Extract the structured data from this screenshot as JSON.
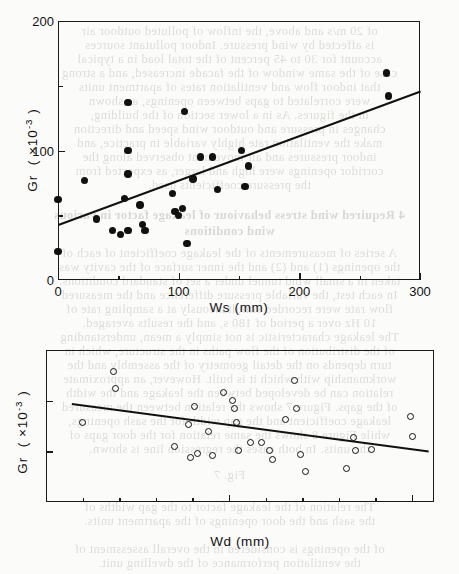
{
  "page": {
    "background_color": "#fbfbf9",
    "ink_color": "#111111"
  },
  "bleed_through_text": {
    "note": "faint mirrored show-through of text printed on the reverse side of the scanned page",
    "lines": [
      {
        "text": "of 20 m/s and above, the inflow of polluted outdoor air",
        "top": 24,
        "bold": false
      },
      {
        "text": "is affected by wind pressure.  Indoor pollutant sources",
        "top": 38,
        "bold": false
      },
      {
        "text": "account for 30 to 45 percent of the total load in a typical",
        "top": 52,
        "bold": false
      },
      {
        "text": "case of the same window of the facade increased, and a strong",
        "top": 66,
        "bold": false
      },
      {
        "text": "that indoor flow and ventilation rates of apartment units",
        "top": 80,
        "bold": false
      },
      {
        "text": "were correlated to gaps between openings, as shown",
        "top": 94,
        "bold": false
      },
      {
        "text": "in the figures.  As in a lower section of the building,",
        "top": 108,
        "bold": false
      },
      {
        "text": "changes in pressure and outdoor wind speed and direction",
        "top": 122,
        "bold": false
      },
      {
        "text": "make the ventilation rate highly variable in practice, and",
        "top": 136,
        "bold": false
      },
      {
        "text": "indoor pressures and air movement observed along the",
        "top": 150,
        "bold": false
      },
      {
        "text": "corridor openings were high and larger, as expected from",
        "top": 164,
        "bold": false
      },
      {
        "text": "the pressure coefficients used.",
        "top": 178,
        "bold": false
      },
      {
        "text": "4  Required wind stress behaviour of leakage factor in various",
        "top": 208,
        "bold": true
      },
      {
        "text": "wind conditions",
        "top": 224,
        "bold": true
      },
      {
        "text": "A series of measurements of the leakage coefficient of each of",
        "top": 246,
        "bold": false
      },
      {
        "text": "the openings (1) and (2) and the inner surface of the cavity was",
        "top": 260,
        "bold": false
      },
      {
        "text": "taken in a small wind tunnel under a set of standard conditions.",
        "top": 274,
        "bold": false
      },
      {
        "text": "In each test, the variable  pressure  difference and the measured",
        "top": 288,
        "bold": false
      },
      {
        "text": "flow rate were recorded simultaneously at a sampling rate of",
        "top": 302,
        "bold": false
      },
      {
        "text": "10 Hz over a period of 180 s, and the results averaged.",
        "top": 316,
        "bold": false
      },
      {
        "text": "The leakage characteristic is not simply a mean, understanding",
        "top": 330,
        "bold": false
      },
      {
        "text": "of the distribution of the flow paths in the structure, which in",
        "top": 344,
        "bold": false
      },
      {
        "text": "turn depends on the detail geometry of the assembly and the",
        "top": 358,
        "bold": false
      },
      {
        "text": "workmanship with which it is built.  However, an approximate",
        "top": 372,
        "bold": false
      },
      {
        "text": "relation can be developed between the leakage and the width",
        "top": 386,
        "bold": false
      },
      {
        "text": "of the gaps.  Figure 7 shows the relation between the measured",
        "top": 400,
        "bold": false
      },
      {
        "text": "leakage coefficient and the gap width for the sash openings,",
        "top": 414,
        "bold": false
      },
      {
        "text": "while Figure 8 shows the same relation for the door gaps of",
        "top": 428,
        "bold": false
      },
      {
        "text": "the units.  In both cases the regression line is shown.",
        "top": 442,
        "bold": false
      },
      {
        "text": "Fig. 7",
        "top": 468,
        "bold": false
      },
      {
        "text": "The relation of the leakage factor to the gap widths of",
        "top": 500,
        "bold": false
      },
      {
        "text": "the sash and the door openings of the apartment units.",
        "top": 514,
        "bold": false
      },
      {
        "text": "of the openings is considered in the overall assessment of",
        "top": 542,
        "bold": false
      },
      {
        "text": "the ventilation performance of the dwelling unit.",
        "top": 556,
        "bold": false
      }
    ]
  },
  "figures": [
    {
      "id": "figure-top",
      "chart_data": {
        "type": "scatter",
        "title": "",
        "xlabel": "Ws (mm)",
        "ylabel": "Gr ( x10-3 )",
        "ylabel_parts": {
          "name": "Gr",
          "open": "(",
          "times": "x10",
          "exponent": "-3",
          "close": ")"
        },
        "xlim": [
          0,
          300
        ],
        "ylim": [
          0,
          200
        ],
        "x_major_ticks": [
          0,
          100,
          200,
          300
        ],
        "x_major_tick_labels": [
          "0",
          "100",
          "200",
          "300"
        ],
        "x_minor_ticks": [
          50,
          150,
          250
        ],
        "y_major_ticks": [
          0,
          100,
          200
        ],
        "y_major_tick_labels": [
          "0",
          "100",
          "200"
        ],
        "y_minor_ticks": [
          50,
          150
        ],
        "grid": false,
        "legend": false,
        "marker": "filled-circle",
        "points": [
          [
            0,
            62
          ],
          [
            0,
            22
          ],
          [
            22,
            77
          ],
          [
            32,
            47
          ],
          [
            45,
            38
          ],
          [
            52,
            35
          ],
          [
            55,
            63
          ],
          [
            58,
            38
          ],
          [
            58,
            100
          ],
          [
            58,
            82
          ],
          [
            58,
            137
          ],
          [
            68,
            58
          ],
          [
            70,
            43
          ],
          [
            72,
            38
          ],
          [
            95,
            67
          ],
          [
            97,
            53
          ],
          [
            100,
            50
          ],
          [
            103,
            55
          ],
          [
            105,
            130
          ],
          [
            107,
            28
          ],
          [
            112,
            78
          ],
          [
            118,
            95
          ],
          [
            128,
            95
          ],
          [
            132,
            70
          ],
          [
            152,
            100
          ],
          [
            155,
            72
          ],
          [
            158,
            88
          ],
          [
            272,
            160
          ],
          [
            274,
            142
          ]
        ],
        "fit_line": {
          "x1": 0,
          "y1": 43,
          "x2": 300,
          "y2": 146,
          "description": "positive linear regression line"
        }
      }
    },
    {
      "id": "figure-bottom",
      "chart_data": {
        "type": "scatter",
        "title": "",
        "xlabel": "Wd (mm)",
        "ylabel": "Gr ( x10-3 )",
        "ylabel_parts": {
          "name": "Gr",
          "open": "(",
          "times": "x10",
          "exponent": "-3",
          "close": ")"
        },
        "xlim": [
          500,
          1560
        ],
        "ylim": [
          0,
          150
        ],
        "x_major_ticks": [
          500,
          1000,
          1500
        ],
        "x_major_tick_labels": [
          "500",
          "1000",
          "1500"
        ],
        "x_minor_ticks": [
          600,
          700,
          800,
          900,
          1100,
          1200,
          1300,
          1400
        ],
        "y_major_ticks": [
          0,
          50,
          100,
          150
        ],
        "y_major_tick_labels": [
          "0",
          "50",
          "100",
          "150"
        ],
        "y_minor_ticks": [],
        "grid": false,
        "legend": false,
        "marker": "open-circle",
        "points": [
          [
            600,
            78
          ],
          [
            685,
            129
          ],
          [
            690,
            112
          ],
          [
            850,
            55
          ],
          [
            890,
            76
          ],
          [
            895,
            44
          ],
          [
            905,
            94
          ],
          [
            915,
            48
          ],
          [
            945,
            70
          ],
          [
            955,
            46
          ],
          [
            985,
            108
          ],
          [
            1010,
            100
          ],
          [
            1015,
            92
          ],
          [
            1020,
            78
          ],
          [
            1025,
            51
          ],
          [
            1060,
            59
          ],
          [
            1090,
            59
          ],
          [
            1110,
            51
          ],
          [
            1120,
            42
          ],
          [
            1155,
            81
          ],
          [
            1180,
            120
          ],
          [
            1185,
            92
          ],
          [
            1195,
            47
          ],
          [
            1210,
            30
          ],
          [
            1320,
            33
          ],
          [
            1340,
            64
          ],
          [
            1345,
            51
          ],
          [
            1390,
            52
          ],
          [
            1495,
            84
          ],
          [
            1500,
            65
          ]
        ],
        "fit_line": {
          "x1": 570,
          "y1": 98,
          "x2": 1545,
          "y2": 51,
          "description": "negative linear regression line"
        }
      }
    }
  ]
}
